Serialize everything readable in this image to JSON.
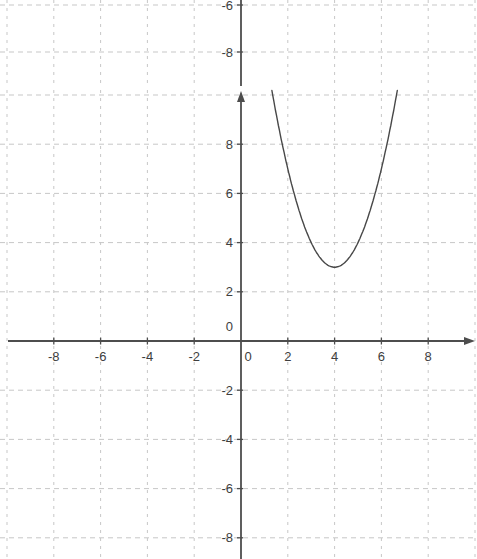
{
  "colors": {
    "background": "#ffffff",
    "grid": "#c7c7c7",
    "axis": "#4d4d4d",
    "curve": "#484848",
    "label": "#3e3e3e"
  },
  "chart_data": [
    {
      "id": "top_strip",
      "type": "line",
      "role": "bottom-edge-of-previous-coordinate-grid",
      "y_tick_labels": [
        "-6",
        "-8"
      ],
      "y_ticks": [
        -6,
        -8
      ],
      "grid": "dashed",
      "series": []
    },
    {
      "id": "main_graph",
      "type": "line",
      "title": "",
      "xlabel": "",
      "ylabel": "",
      "x_tick_labels": [
        "-8",
        "-6",
        "-4",
        "-2",
        "0",
        "2",
        "4",
        "6",
        "8"
      ],
      "y_tick_labels": [
        "8",
        "6",
        "4",
        "2",
        "0",
        "-2",
        "-4",
        "-6",
        "-8"
      ],
      "x_ticks": [
        -8,
        -6,
        -4,
        -2,
        0,
        2,
        4,
        6,
        8
      ],
      "y_ticks": [
        8,
        6,
        4,
        2,
        0,
        -2,
        -4,
        -6,
        -8
      ],
      "grid_x": [
        -10,
        -8,
        -6,
        -4,
        -2,
        2,
        4,
        6,
        8,
        10
      ],
      "grid_y": [
        10,
        8,
        6,
        4,
        2,
        -2,
        -4,
        -6,
        -8
      ],
      "x_range": [
        -10.1,
        10.1
      ],
      "y_range": [
        -8.9,
        10.2
      ],
      "grid": "dashed",
      "legend": "none",
      "series": [
        {
          "name": "parabola",
          "kind": "quadratic-vertex-form",
          "equation": "y = (x - 4)^2 + 3",
          "a": 1,
          "vertex": [
            4,
            3
          ],
          "x_domain": [
            1.32,
            6.68
          ],
          "sample_points": [
            [
              1.32,
              10.18
            ],
            [
              2,
              7
            ],
            [
              3,
              4
            ],
            [
              4,
              3
            ],
            [
              5,
              4
            ],
            [
              6,
              7
            ],
            [
              6.68,
              10.18
            ]
          ]
        }
      ]
    }
  ]
}
